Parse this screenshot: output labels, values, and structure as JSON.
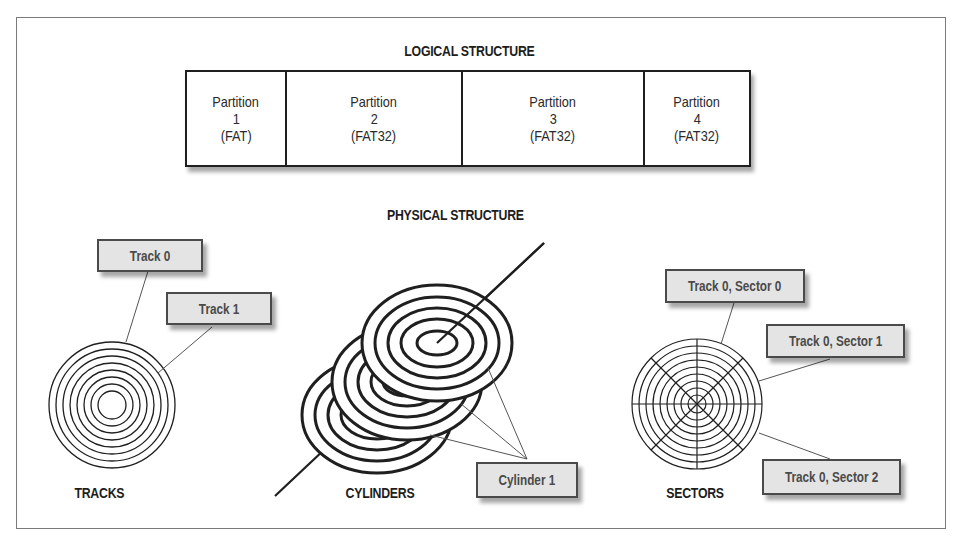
{
  "logical": {
    "title": "LOGICAL STRUCTURE",
    "partitions": [
      {
        "name": "Partition",
        "number": "1",
        "fs": "(FAT)"
      },
      {
        "name": "Partition",
        "number": "2",
        "fs": "(FAT32)"
      },
      {
        "name": "Partition",
        "number": "3",
        "fs": "(FAT32)"
      },
      {
        "name": "Partition",
        "number": "4",
        "fs": "(FAT32)"
      }
    ]
  },
  "physical": {
    "title": "PHYSICAL STRUCTURE",
    "tracks": {
      "caption": "TRACKS",
      "labels": [
        "Track 0",
        "Track 1"
      ]
    },
    "cylinders": {
      "caption": "CYLINDERS",
      "labels": [
        "Cylinder 1"
      ]
    },
    "sectors": {
      "caption": "SECTORS",
      "labels": [
        "Track 0, Sector 0",
        "Track 0, Sector 1",
        "Track 0, Sector 2"
      ]
    }
  },
  "colors": {
    "line": "#1f1f1f",
    "label_bg": "#e4e4e4",
    "label_text": "#4a4a4a",
    "frame": "#7a7a7a"
  }
}
